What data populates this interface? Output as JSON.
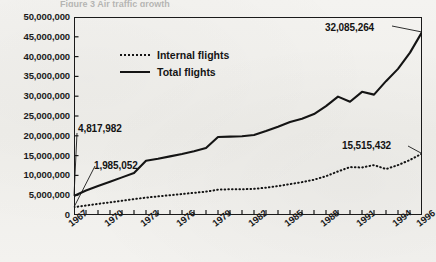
{
  "caption_sliver": "Figure 3  Air traffic growth",
  "legend": {
    "position": "inside-top-left",
    "entries": [
      {
        "label": "Internal flights",
        "style": "dotted",
        "icon": "dotted-line-icon"
      },
      {
        "label": "Total flights",
        "style": "solid",
        "icon": "solid-line-icon"
      }
    ]
  },
  "axes": {
    "y_tick_labels": [
      "50,000,000",
      "45,000,000",
      "40,000,000",
      "35,000,000",
      "30,000,000",
      "25,000,000",
      "20,000,000",
      "15,000,000",
      "10,000,000",
      "5,000,000",
      "0"
    ],
    "x_tick_labels": [
      "1967",
      "1970",
      "1973",
      "1976",
      "1979",
      "1982",
      "1985",
      "1988",
      "1991",
      "1994",
      "1996"
    ]
  },
  "callouts": [
    {
      "name": "total-start-value",
      "value": "4,817,982"
    },
    {
      "name": "internal-start-value",
      "value": "1,985,052"
    },
    {
      "name": "total-end-value",
      "value": "32,085,264"
    },
    {
      "name": "internal-end-value",
      "value": "15,515,432"
    }
  ],
  "colors": {
    "ink": "#141414",
    "paper": "#f2f1ee"
  },
  "chart_data": {
    "type": "line",
    "title": "",
    "xlabel": "",
    "ylabel": "",
    "ylim": [
      0,
      50000000
    ],
    "xlim": [
      1967,
      1996
    ],
    "grid": false,
    "legend_position": "inside-top-left",
    "y_tick_values": [
      0,
      5000000,
      10000000,
      15000000,
      20000000,
      25000000,
      30000000,
      35000000,
      40000000,
      45000000,
      50000000
    ],
    "x": [
      1967,
      1968,
      1969,
      1970,
      1971,
      1972,
      1973,
      1974,
      1975,
      1976,
      1977,
      1978,
      1979,
      1980,
      1981,
      1982,
      1983,
      1984,
      1985,
      1986,
      1987,
      1988,
      1989,
      1990,
      1991,
      1992,
      1993,
      1994,
      1995,
      1996
    ],
    "series": [
      {
        "name": "Total flights",
        "style": "solid",
        "values": [
          4817982,
          6200000,
          7300000,
          8400000,
          9500000,
          10600000,
          13700000,
          14200000,
          14800000,
          15400000,
          16100000,
          16900000,
          19700000,
          19800000,
          19900000,
          20200000,
          21200000,
          22300000,
          23500000,
          24300000,
          25500000,
          27500000,
          29900000,
          28600000,
          31100000,
          30400000,
          33800000,
          36900000,
          41000000,
          46200000
        ]
      },
      {
        "name": "Internal flights",
        "style": "dotted",
        "values": [
          1985052,
          2400000,
          2800000,
          3200000,
          3600000,
          4000000,
          4400000,
          4700000,
          5000000,
          5300000,
          5600000,
          5900000,
          6400000,
          6500000,
          6500000,
          6600000,
          6900000,
          7300000,
          7800000,
          8300000,
          8900000,
          9800000,
          11000000,
          12100000,
          12000000,
          12600000,
          11600000,
          12600000,
          13900000,
          15515432
        ]
      }
    ],
    "annotations": [
      {
        "text": "4,817,982",
        "target_series": "Total flights",
        "target_x": 1967,
        "target_y": 4817982
      },
      {
        "text": "1,985,052",
        "target_series": "Internal flights",
        "target_x": 1967,
        "target_y": 1985052
      },
      {
        "text": "32,085,264",
        "target_series": "Total flights",
        "target_x": 1996,
        "target_y": 46200000
      },
      {
        "text": "15,515,432",
        "target_series": "Internal flights",
        "target_x": 1996,
        "target_y": 15515432
      }
    ]
  }
}
